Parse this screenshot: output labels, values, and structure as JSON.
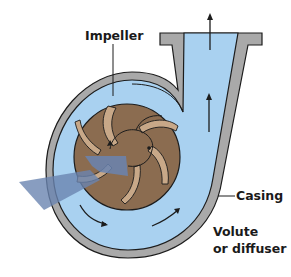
{
  "diagram": {
    "labels": {
      "impeller": "Impeller",
      "casing": "Casing",
      "volute_line1": "Volute",
      "volute_line2": "or diffuser"
    },
    "colors": {
      "casing": "#a9a9a9",
      "water": "#a9d1f0",
      "impeller": "#8b6c50",
      "blade": "#c8a888",
      "outline": "#1c1c1c",
      "inlet_flow": "#6a84b0"
    },
    "flow_arrows": [
      "outlet-up",
      "discharge-up",
      "volute-bottom-left",
      "volute-bottom-right"
    ]
  }
}
